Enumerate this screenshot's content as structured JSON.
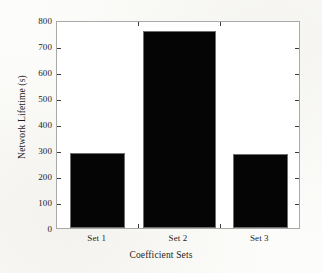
{
  "chart_data": {
    "type": "bar",
    "title": "",
    "categories": [
      "Set 1",
      "Set 2",
      "Set 3"
    ],
    "values": [
      287,
      757,
      286
    ],
    "series": [
      {
        "name": "Network Lifetime",
        "values": [
          287,
          757,
          286
        ]
      }
    ],
    "xlabel": "Coefficient Sets",
    "ylabel": "Network Lifetime (s)",
    "ylim": [
      0,
      800
    ],
    "yticks": [
      0,
      100,
      200,
      300,
      400,
      500,
      600,
      700,
      800
    ],
    "ytick_labels": [
      "0",
      "100",
      "200",
      "300",
      "400",
      "500",
      "600",
      "700",
      "800"
    ],
    "grid": false,
    "legend": false,
    "bar_color": "#050505",
    "axis_color": "#a9a9a9",
    "background_color": "#ffffff"
  }
}
